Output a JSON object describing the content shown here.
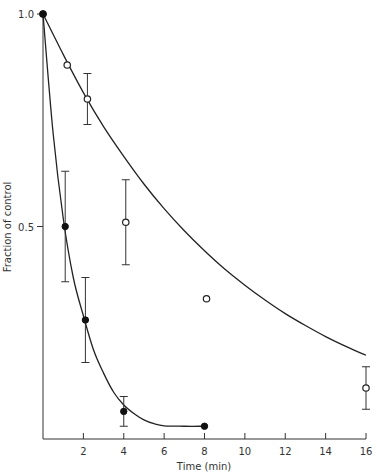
{
  "chart_data": {
    "type": "line",
    "title": "",
    "xlabel": "Time (min)",
    "ylabel": "Fraction of control",
    "xlim": [
      0,
      16
    ],
    "ylim": [
      0,
      1.0
    ],
    "x_ticks": [
      2,
      4,
      6,
      8,
      10,
      12,
      14,
      16
    ],
    "x_tick_labels": [
      "2",
      "4",
      "6",
      "8",
      "10",
      "12",
      "14",
      "16"
    ],
    "y_ticks": [
      0.5,
      1.0
    ],
    "y_tick_labels": [
      "0.5",
      "1.0"
    ],
    "grid": false,
    "legend": null,
    "series": [
      {
        "name": "open circles",
        "marker": "open-circle",
        "points": [
          {
            "x": 0,
            "y": 1.0
          },
          {
            "x": 1.2,
            "y": 0.88
          },
          {
            "x": 2.2,
            "y": 0.8,
            "err_low": 0.74,
            "err_high": 0.86
          },
          {
            "x": 4.1,
            "y": 0.51,
            "err_low": 0.41,
            "err_high": 0.61
          },
          {
            "x": 8.1,
            "y": 0.33
          },
          {
            "x": 16,
            "y": 0.12,
            "err_low": 0.07,
            "err_high": 0.17
          }
        ],
        "curve": [
          [
            0,
            1.0
          ],
          [
            1,
            0.905
          ],
          [
            2,
            0.815
          ],
          [
            3,
            0.735
          ],
          [
            4,
            0.665
          ],
          [
            5,
            0.6
          ],
          [
            6,
            0.542
          ],
          [
            7,
            0.49
          ],
          [
            8,
            0.443
          ],
          [
            9,
            0.4
          ],
          [
            10,
            0.362
          ],
          [
            11,
            0.327
          ],
          [
            12,
            0.295
          ],
          [
            13,
            0.267
          ],
          [
            14,
            0.241
          ],
          [
            15,
            0.218
          ],
          [
            16,
            0.197
          ]
        ]
      },
      {
        "name": "filled circles",
        "marker": "filled-circle",
        "points": [
          {
            "x": 0,
            "y": 1.0
          },
          {
            "x": 1.1,
            "y": 0.5,
            "err_low": 0.37,
            "err_high": 0.63
          },
          {
            "x": 2.1,
            "y": 0.28,
            "err_low": 0.18,
            "err_high": 0.38
          },
          {
            "x": 4.0,
            "y": 0.065,
            "err_low": 0.03,
            "err_high": 0.1
          },
          {
            "x": 8.0,
            "y": 0.03
          }
        ],
        "curve": [
          [
            0,
            1.0
          ],
          [
            0.5,
            0.72
          ],
          [
            1,
            0.52
          ],
          [
            1.5,
            0.38
          ],
          [
            2,
            0.29
          ],
          [
            2.5,
            0.21
          ],
          [
            3,
            0.155
          ],
          [
            3.5,
            0.11
          ],
          [
            4,
            0.08
          ],
          [
            4.5,
            0.06
          ],
          [
            5,
            0.045
          ],
          [
            5.5,
            0.036
          ],
          [
            6,
            0.031
          ],
          [
            7,
            0.03
          ],
          [
            8,
            0.03
          ]
        ]
      }
    ]
  }
}
